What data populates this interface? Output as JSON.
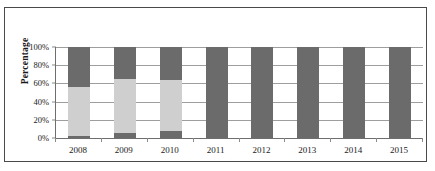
{
  "chart_data": {
    "type": "bar",
    "stacked": true,
    "normalized_percent": true,
    "title": "",
    "subtitle": "",
    "xlabel": "",
    "ylabel": "Percentage",
    "ylim": [
      0,
      100
    ],
    "ytick_labels": [
      "100%",
      "80%",
      "60%",
      "40%",
      "20%",
      "0%"
    ],
    "ytick_values": [
      100,
      80,
      60,
      40,
      20,
      0
    ],
    "grid": true,
    "grid_axis": "y",
    "legend": "none",
    "categories": [
      "2008",
      "2009",
      "2010",
      "2011",
      "2012",
      "2013",
      "2014",
      "2015"
    ],
    "series": [
      {
        "name": "series-1-bottom",
        "color": "#6b6b6b",
        "values": [
          2,
          5,
          8,
          0,
          0,
          0,
          0,
          0
        ]
      },
      {
        "name": "series-2-middle",
        "color": "#cfcfcf",
        "values": [
          54,
          60,
          56,
          0,
          0,
          0,
          0,
          0
        ]
      },
      {
        "name": "series-3-top",
        "color": "#6b6b6b",
        "values": [
          44,
          35,
          36,
          100,
          100,
          100,
          100,
          100
        ]
      }
    ]
  },
  "axes": {
    "y_title": "Percentage",
    "y_ticks": [
      {
        "label": "100%",
        "value": 100
      },
      {
        "label": "80%",
        "value": 80
      },
      {
        "label": "60%",
        "value": 60
      },
      {
        "label": "40%",
        "value": 40
      },
      {
        "label": "20%",
        "value": 20
      },
      {
        "label": "0%",
        "value": 0
      }
    ],
    "x_ticks": [
      {
        "label": "2008"
      },
      {
        "label": "2009"
      },
      {
        "label": "2010"
      },
      {
        "label": "2011"
      },
      {
        "label": "2012"
      },
      {
        "label": "2013"
      },
      {
        "label": "2014"
      },
      {
        "label": "2015"
      }
    ]
  },
  "colors": {
    "dark_gray": "#6b6b6b",
    "light_gray": "#cfcfcf",
    "frame": "#4a4a4a",
    "gridline": "#9e9e9e",
    "axis": "#6e6e6e",
    "text": "#1a1a1a",
    "background": "#ffffff"
  }
}
